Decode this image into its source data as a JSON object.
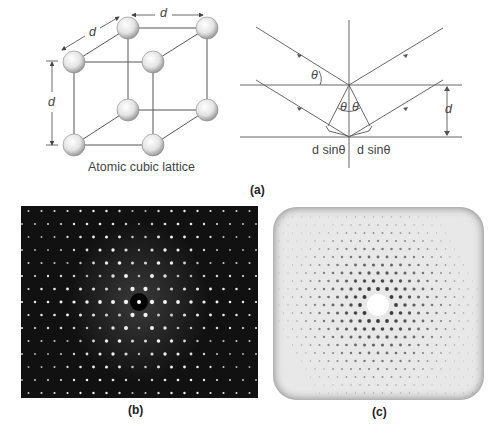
{
  "figure": {
    "panel_a": {
      "label": "(a)",
      "lattice": {
        "caption": "Atomic cubic lattice",
        "dimension_labels": [
          "d",
          "d",
          "d"
        ]
      },
      "bragg": {
        "angle_symbol": "θ",
        "spacing_label": "d",
        "path_diff_left": "d sinθ",
        "path_diff_right": "d sinθ"
      }
    },
    "panel_b": {
      "label": "(b)",
      "description": "Electron diffraction pattern, bright spots on dark background"
    },
    "panel_c": {
      "label": "(c)",
      "description": "X-ray diffraction pattern, dark spots on light background"
    },
    "colors": {
      "line": "#555555",
      "sphere_light": "#f4f4f4",
      "sphere_dark": "#a8a8a8",
      "panel_b_bg": "#111111",
      "panel_c_bg": "#e6e6e6",
      "text": "#444444"
    }
  }
}
